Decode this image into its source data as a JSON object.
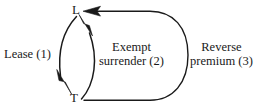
{
  "diagram": {
    "type": "cycle-diagram",
    "background_color": "#ffffff",
    "stroke_color": "#1a1a1a",
    "text_color": "#1a1a1a",
    "nodes": [
      {
        "id": "L",
        "label": "L",
        "x": 78,
        "y": 11
      },
      {
        "id": "T",
        "label": "T",
        "x": 76,
        "y": 98
      }
    ],
    "edges": [
      {
        "id": "lease",
        "label_line1": "Lease (1)",
        "label_line2": "",
        "number": "1",
        "from": "L",
        "to": "T",
        "direction": "down",
        "side": "left"
      },
      {
        "id": "exempt-surrender",
        "label_line1": "Exempt",
        "label_line2": "surrender (2)",
        "number": "2",
        "from": "T",
        "to": "L",
        "direction": "up",
        "side": "middle"
      },
      {
        "id": "reverse-premium",
        "label_line1": "Reverse",
        "label_line2": "premium (3)",
        "number": "3",
        "from": "T",
        "to": "L",
        "direction": "up-around",
        "side": "right"
      }
    ]
  }
}
